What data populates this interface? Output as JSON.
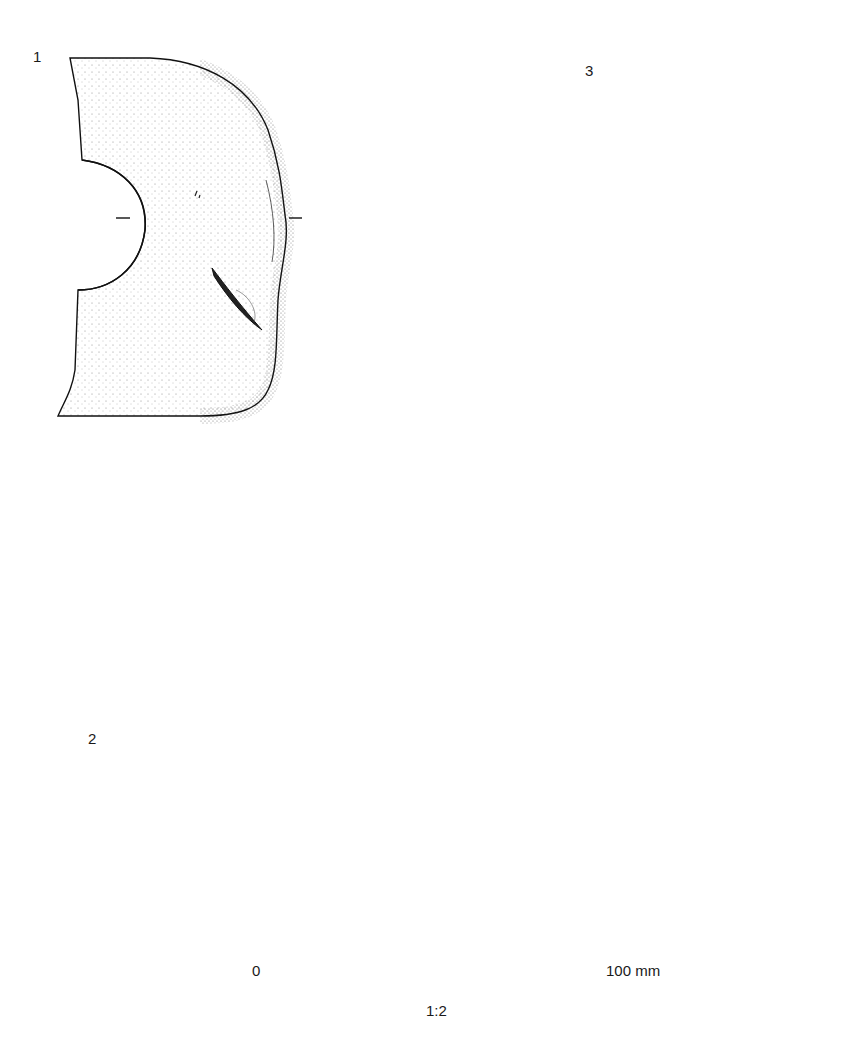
{
  "figure": {
    "objects": [
      {
        "number": "1",
        "view": "plan with cross-section"
      },
      {
        "number": "2",
        "view": "ring with cross-section"
      },
      {
        "number": "3",
        "view": "elongated pebble with cross-section"
      }
    ]
  },
  "scale_bar": {
    "start_label": "0",
    "end_label": "100 mm",
    "ratio": "1:2",
    "segments": 5
  },
  "colors": {
    "ink": "#111111",
    "paper": "#ffffff",
    "stipple": "#555555"
  }
}
